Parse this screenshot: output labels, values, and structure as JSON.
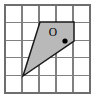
{
  "figure": {
    "canvas": {
      "width": 100,
      "height": 102,
      "background": "#ffffff"
    },
    "grid": {
      "columns": 5,
      "rows": 5,
      "x_start": 5,
      "y_start": 5,
      "x_end": 90,
      "y_end": 93,
      "cell_width": 17,
      "cell_height": 17.6,
      "line_color": "#808080",
      "border_color": "#6e6e6e",
      "visible": true
    },
    "polygon": {
      "name": "shaded-quadrilateral",
      "points": "40,22 74,22 74,41 23,76",
      "vertices": [
        {
          "x": 40,
          "y": 22
        },
        {
          "x": 74,
          "y": 22
        },
        {
          "x": 74,
          "y": 41
        },
        {
          "x": 23,
          "y": 76
        }
      ],
      "fill_color": "#b9b9b9",
      "stroke_color": "#1a1a1a"
    },
    "point": {
      "label": "O",
      "label_x": 53,
      "label_y": 33,
      "dot_x": 65,
      "dot_y": 41,
      "dot_radius": 2.6,
      "dot_color": "#000000"
    }
  }
}
